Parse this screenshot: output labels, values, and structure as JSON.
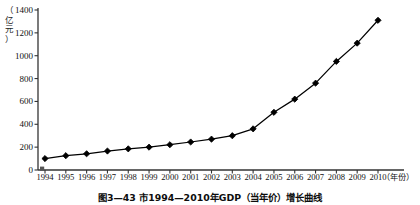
{
  "figure": {
    "caption": "图3—43  市1994—2010年GDP（当年价）增长曲线",
    "y_unit_chars": [
      "（",
      "亿",
      "元",
      "）"
    ],
    "x_unit": "（年份）"
  },
  "chart_data": {
    "type": "line",
    "title": "",
    "subtitle": "",
    "xlabel": "（年份）",
    "ylabel": "（亿元）",
    "x": [
      1994,
      1995,
      1996,
      1997,
      1998,
      1999,
      2000,
      2001,
      2002,
      2003,
      2004,
      2005,
      2006,
      2007,
      2008,
      2009,
      2010
    ],
    "categories": [
      "1994",
      "1995",
      "1996",
      "1997",
      "1998",
      "1999",
      "2000",
      "2001",
      "2002",
      "2003",
      "2004",
      "2005",
      "2006",
      "2007",
      "2008",
      "2009",
      "2010"
    ],
    "values": [
      100,
      125,
      142,
      166,
      185,
      200,
      221,
      245,
      270,
      300,
      360,
      505,
      620,
      760,
      950,
      1110,
      1310
    ],
    "series": [
      {
        "name": "GDP（当年价）",
        "values": [
          100,
          125,
          142,
          166,
          185,
          200,
          221,
          245,
          270,
          300,
          360,
          505,
          620,
          760,
          950,
          1110,
          1310
        ]
      }
    ],
    "ylim": [
      0,
      1400
    ],
    "yticks": [
      0,
      200,
      400,
      600,
      800,
      1000,
      1200,
      1400
    ],
    "ytick_labels": [
      "0",
      "200",
      "400",
      "600",
      "800",
      "1000",
      "1200",
      "1400"
    ],
    "xlim": [
      1994,
      2010
    ],
    "grid": false,
    "legend": false,
    "legend_position": "none",
    "marker": "diamond",
    "marker_color": "#000000",
    "line_color": "#000000",
    "annotations": []
  }
}
